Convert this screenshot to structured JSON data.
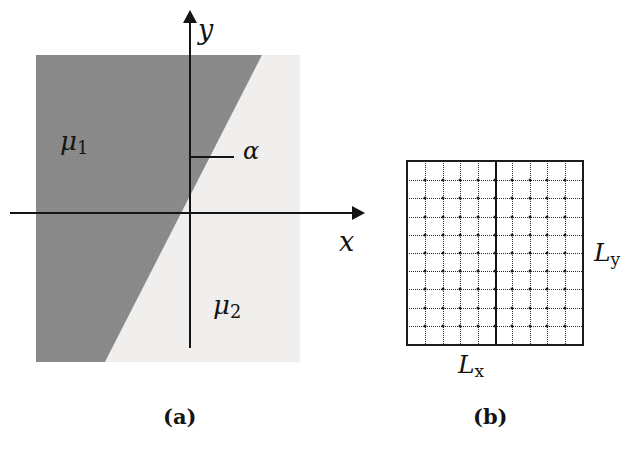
{
  "figure": {
    "panels": [
      {
        "id": "a",
        "caption": "(a)",
        "description": "Two half-plane media separated by an interface through the origin at angle alpha"
      },
      {
        "id": "b",
        "caption": "(b)",
        "description": "Rectangular computational lattice of size Lx by Ly"
      }
    ]
  },
  "panel_a": {
    "axes": {
      "x_label": "x",
      "y_label": "y"
    },
    "regions": [
      {
        "name": "region-mu1",
        "label": "μ",
        "subscript": "1",
        "fill": "#8a8a8a"
      },
      {
        "name": "region-mu2",
        "label": "μ",
        "subscript": "2",
        "fill": "#f3f2f0"
      }
    ],
    "angle": {
      "label": "α",
      "description": "angle between the reference horizontal segment and the interface line"
    }
  },
  "panel_b": {
    "grid": {
      "horizontal_lines": 9,
      "vertical_lines": 9,
      "emphasis_column_index": 4,
      "line_style": "dotted",
      "emphasis_style": "solid",
      "border_color": "#1b1b1b"
    },
    "labels": {
      "width_label": "L",
      "width_subscript": "x",
      "height_label": "L",
      "height_subscript": "y"
    }
  },
  "colors": {
    "ink": "#141414",
    "mu1_fill": "#8a8a8a",
    "mu2_fill": "#f3f2f0",
    "paper": "#ffffff"
  }
}
